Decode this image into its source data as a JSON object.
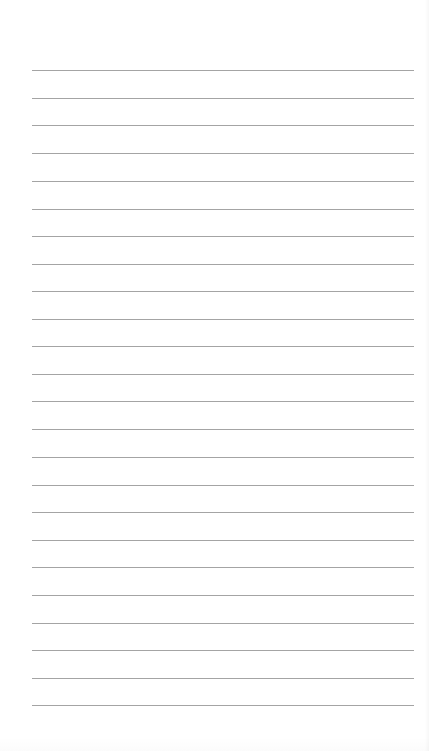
{
  "document": {
    "type": "lined-paper",
    "background_color": "#ffffff",
    "line_color": "#9a9a9a",
    "line_left": 32,
    "line_right": 414,
    "line_count": 24,
    "line_positions_y": [
      70,
      98,
      125,
      153,
      181,
      209,
      236,
      264,
      291,
      319,
      346,
      374,
      401,
      429,
      457,
      485,
      512,
      540,
      567,
      595,
      623,
      650,
      678,
      705
    ],
    "text_content": []
  }
}
